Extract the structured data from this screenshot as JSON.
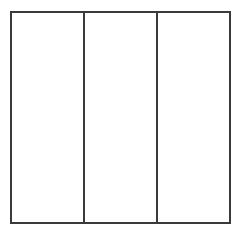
{
  "diagram": {
    "type": "partitioned-square",
    "orientation": "vertical",
    "parts": 3,
    "shaded_parts": 0,
    "line_color": "#3a3a3a",
    "fill_color": "#ffffff",
    "strips": [
      {
        "index": 1,
        "shaded": false
      },
      {
        "index": 2,
        "shaded": false
      },
      {
        "index": 3,
        "shaded": false
      }
    ]
  }
}
